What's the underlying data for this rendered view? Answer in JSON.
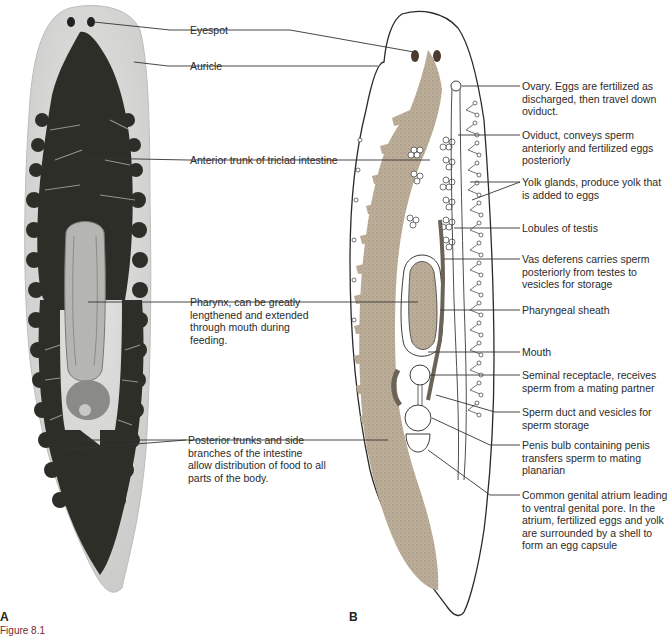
{
  "figure": {
    "panel_a_letter": "A",
    "panel_b_letter": "B",
    "caption_fragment": "Figure 8.1"
  },
  "panel_a_labels": [
    {
      "id": "eyespot",
      "text": "Eyespot"
    },
    {
      "id": "auricle",
      "text": "Auricle"
    },
    {
      "id": "anterior-trunk",
      "text": "Anterior trunk of triclad intestine"
    },
    {
      "id": "pharynx",
      "text": "Pharynx, can be greatly lengthened and extended through mouth during feeding."
    },
    {
      "id": "posterior-trunks",
      "text": "Posterior trunks and side branches of the intestine allow distribution of food to all parts of the body."
    }
  ],
  "panel_b_labels": [
    {
      "id": "ovary",
      "text": "Ovary. Eggs are fertilized as discharged, then travel down oviduct."
    },
    {
      "id": "oviduct",
      "text": "Oviduct, conveys sperm anteriorly and fertilized eggs posteriorly"
    },
    {
      "id": "yolk-glands",
      "text": "Yolk glands, produce yolk that is added to eggs"
    },
    {
      "id": "testis-lobules",
      "text": "Lobules of testis"
    },
    {
      "id": "vas-deferens",
      "text": "Vas deferens carries sperm posteriorly from testes to vesicles for storage"
    },
    {
      "id": "pharyngeal-sheath",
      "text": "Pharyngeal sheath"
    },
    {
      "id": "mouth",
      "text": "Mouth"
    },
    {
      "id": "seminal-receptacle",
      "text": "Seminal receptacle, receives sperm from a mating partner"
    },
    {
      "id": "sperm-duct",
      "text": "Sperm duct and vesicles for sperm storage"
    },
    {
      "id": "penis-bulb",
      "text": "Penis bulb containing penis transfers sperm to mating planarian"
    },
    {
      "id": "genital-atrium",
      "text": "Common genital atrium leading to ventral genital pore. In the atrium, fertilized eggs and yolk are surrounded by a shell to form an egg capsule"
    }
  ],
  "colors": {
    "intestine_photo": "#2b2b26",
    "body_photo": "#d8d8d6",
    "intestine_diagram": "#b7a994",
    "outline": "#2a2a2a",
    "sperm_duct": "#6b6258"
  }
}
